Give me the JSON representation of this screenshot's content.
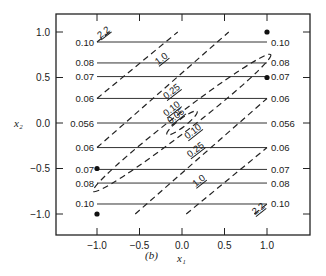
{
  "chart_data": {
    "type": "line",
    "panel_label": "(b)",
    "xlabel": "x₁",
    "ylabel": "x₂",
    "xlim": [
      -1.3,
      1.5
    ],
    "ylim": [
      -1.2,
      1.2
    ],
    "xticks": [
      -1.0,
      -0.5,
      0.0,
      0.5,
      1.0
    ],
    "xtick_labels": [
      "−1.0",
      "−0.5",
      "0.0",
      "0.5",
      "1.0"
    ],
    "yticks": [
      1.0,
      0.5,
      0.0,
      -0.5,
      -1.0
    ],
    "ytick_labels": [
      "1.0",
      "0.5",
      "0.0",
      "−0.5",
      "−1.0"
    ],
    "grid": false,
    "solid_contours": [
      {
        "level": "0.10",
        "y": 0.89
      },
      {
        "level": "0.08",
        "y": 0.66
      },
      {
        "level": "0.07",
        "y": 0.51
      },
      {
        "level": "0.06",
        "y": 0.27
      },
      {
        "level": "0.056",
        "y": 0.0
      },
      {
        "level": "0.06",
        "y": -0.27
      },
      {
        "level": "0.07",
        "y": -0.51
      },
      {
        "level": "0.08",
        "y": -0.66
      },
      {
        "level": "0.10",
        "y": -0.89
      }
    ],
    "solid_contour_xrange": [
      -1.0,
      1.0
    ],
    "dashed_contours": [
      {
        "level": "2.2",
        "points": [
          [
            -1.0,
            0.89
          ],
          [
            -0.85,
            1.0
          ]
        ]
      },
      {
        "level": "2.2",
        "points": [
          [
            0.85,
            -1.0
          ],
          [
            1.0,
            -0.89
          ]
        ]
      },
      {
        "level": "1.0",
        "points": [
          [
            -1.0,
            0.27
          ],
          [
            -0.05,
            1.0
          ]
        ]
      },
      {
        "level": "1.0",
        "points": [
          [
            0.05,
            -1.0
          ],
          [
            1.0,
            -0.27
          ]
        ]
      },
      {
        "level": "0.25",
        "points": [
          [
            -1.0,
            -0.27
          ],
          [
            0.55,
            1.0
          ]
        ]
      },
      {
        "level": "0.25",
        "points": [
          [
            -0.55,
            -1.0
          ],
          [
            1.0,
            0.27
          ]
        ]
      },
      {
        "level": "0.10",
        "closed": true,
        "center": [
          0,
          0
        ],
        "note": "elongated ellipse along diagonal, ends near (-1.0,-0.72) and (1.0,0.72)"
      },
      {
        "level": "0.05",
        "closed": true,
        "center": [
          0,
          0
        ],
        "note": "small ellipse around origin"
      }
    ],
    "points": [
      {
        "x": 1.0,
        "y": 1.0
      },
      {
        "x": 1.0,
        "y": 0.5
      },
      {
        "x": -1.0,
        "y": -0.5
      },
      {
        "x": -1.0,
        "y": -1.0
      }
    ],
    "left_labels": [
      "0.10",
      "0.08",
      "0.07",
      "0.06",
      "0.056",
      "0.06",
      "0.07",
      "0.08",
      "0.10"
    ],
    "right_labels": [
      "0.10",
      "0.08",
      "0.07",
      "0.06",
      "0.056",
      "0.06",
      "0.07",
      "0.08",
      "0.10"
    ],
    "dashed_labels": [
      "2.2",
      "1.0",
      "0.25",
      "0.10",
      "0.05",
      "0.10",
      "0.25",
      "1.0",
      "2.2"
    ]
  }
}
